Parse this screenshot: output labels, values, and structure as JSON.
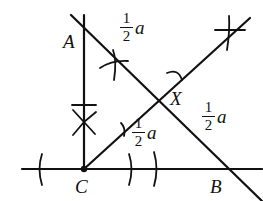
{
  "diagram": {
    "title": "",
    "points": {
      "A": {
        "label": "A"
      },
      "B": {
        "label": "B"
      },
      "C": {
        "label": "C"
      },
      "X": {
        "label": "X"
      }
    },
    "segment_labels": [
      {
        "id": "AX",
        "numerator": "1",
        "denominator": "2",
        "variable": "a"
      },
      {
        "id": "XB",
        "numerator": "1",
        "denominator": "2",
        "variable": "a"
      },
      {
        "id": "CX",
        "numerator": "1",
        "denominator": "2",
        "variable": "a"
      }
    ],
    "colors": {
      "stroke": "#111111",
      "background": "#ffffff"
    }
  }
}
